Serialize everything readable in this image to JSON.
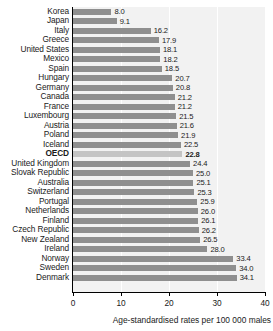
{
  "chart_data": {
    "type": "bar",
    "orientation": "horizontal",
    "title": "",
    "xlabel": "Age-standardised rates per 100 000 males",
    "ylabel": "",
    "xlim": [
      0,
      40
    ],
    "xticks": [
      0,
      10,
      20,
      30,
      40
    ],
    "xtick_labels": [
      "0",
      "10",
      "20",
      "30",
      "40"
    ],
    "grid": true,
    "grid_axis": "x",
    "legend": null,
    "highlight_category": "OECD",
    "bar_color": "#8f8f8f",
    "highlight_bar_color": "#c4c4c4",
    "plot_background": "#f2f2f2",
    "categories": [
      "Korea",
      "Japan",
      "Italy",
      "Greece",
      "United States",
      "Mexico",
      "Spain",
      "Hungary",
      "Germany",
      "Canada",
      "France",
      "Luxembourg",
      "Austria",
      "Poland",
      "Iceland",
      "OECD",
      "United Kingdom",
      "Slovak Republic",
      "Australia",
      "Switzerland",
      "Portugal",
      "Netherlands",
      "Finland",
      "Czech Republic",
      "New Zealand",
      "Ireland",
      "Norway",
      "Sweden",
      "Denmark"
    ],
    "values": [
      8.0,
      9.1,
      16.2,
      17.9,
      18.1,
      18.2,
      18.5,
      20.7,
      20.8,
      21.2,
      21.2,
      21.5,
      21.6,
      21.9,
      22.5,
      22.8,
      24.4,
      25.0,
      25.1,
      25.3,
      25.9,
      26.0,
      26.1,
      26.2,
      26.5,
      28.0,
      33.4,
      34.0,
      34.1
    ],
    "value_labels": [
      "8.0",
      "9.1",
      "16.2",
      "17.9",
      "18.1",
      "18.2",
      "18.5",
      "20.7",
      "20.8",
      "21.2",
      "21.2",
      "21.5",
      "21.6",
      "21.9",
      "22.5",
      "22.8",
      "24.4",
      "25.0",
      "25.1",
      "25.3",
      "25.9",
      "26.0",
      "26.1",
      "26.2",
      "26.5",
      "28.0",
      "33.4",
      "34.0",
      "34.1"
    ]
  }
}
